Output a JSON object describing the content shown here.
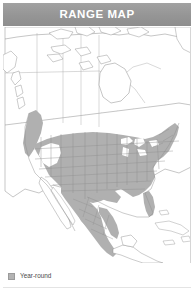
{
  "header": {
    "title": "RANGE MAP",
    "background_color": "#9a9a9a",
    "text_color": "#ffffff"
  },
  "map": {
    "name": "north-america-range-map",
    "projection_region": "North America",
    "ocean_color": "#ffffff",
    "land_color": "#ffffff",
    "border_color": "#8d8d8d",
    "subdivision_color": "#a5a5a5",
    "range_fill_color": "#b0b0b0",
    "range_description": "Year-round range shading covers the contiguous United States, the Pacific Northwest coastal strip into southern British Columbia, and extends south through the Mexican highlands; unshaded in most of Canada, the Great Basin interior, Baja California, Central America and the Caribbean."
  },
  "legend": {
    "items": [
      {
        "label": "Year-round",
        "swatch_color": "#b3b3b3",
        "icon": "square-swatch-icon"
      }
    ]
  }
}
